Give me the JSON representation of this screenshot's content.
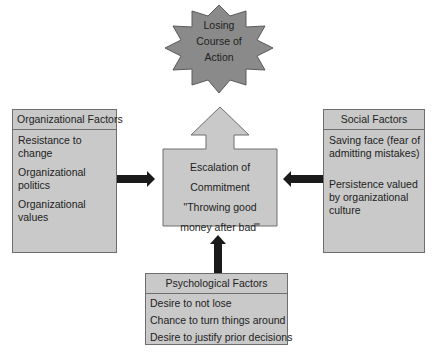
{
  "outcome": {
    "lines": [
      "Losing",
      "Course of",
      "Action"
    ],
    "fill": "#8a8a8a"
  },
  "center": {
    "lines": [
      "Escalation of",
      "Commitment",
      "\"Throwing good",
      "money after bad\""
    ]
  },
  "organizational": {
    "title": "Organizational Factors",
    "items": [
      "Resistance to change",
      "Organizational politics",
      "Organizational values"
    ]
  },
  "social": {
    "title": "Social Factors",
    "items": [
      "Saving face (fear of admitting mistakes)",
      "Persistence valued by organizational culture"
    ]
  },
  "psychological": {
    "title": "Psychological Factors",
    "items": [
      "Desire to not lose",
      "Chance to turn things around",
      "Desire to justify prior decisions"
    ]
  },
  "colors": {
    "box_fill": "#c9c9c9",
    "border": "#6e6e6e",
    "arrow": "#1a1a1a"
  }
}
